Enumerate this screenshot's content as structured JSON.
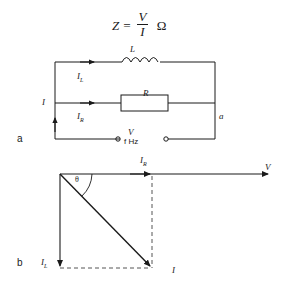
{
  "figure": {
    "equation": {
      "lhs": "Z",
      "equals": "=",
      "numerator": "V",
      "denominator": "I",
      "unit": "Ω"
    },
    "panel_a": {
      "tag": "a",
      "components": {
        "inductor_label": "L",
        "resistor_label": "R"
      },
      "currents": {
        "total": "I",
        "inductor_branch": "I",
        "inductor_branch_sub": "L",
        "resistor_branch": "I",
        "resistor_branch_sub": "R"
      },
      "source": {
        "voltage": "V",
        "frequency": "f Hz"
      },
      "terminal_right": "a"
    },
    "panel_b": {
      "tag": "b",
      "phasors": [
        {
          "name": "I",
          "sub": "R",
          "label": "I_R",
          "direction": "horizontal-right",
          "meaning": "resistive current in phase with V"
        },
        {
          "name": "I",
          "sub": "L",
          "label": "I_L",
          "direction": "vertical-down",
          "meaning": "inductive current lagging V by 90 degrees"
        },
        {
          "name": "I",
          "sub": "",
          "label": "I",
          "direction": "diagonal-down-right",
          "meaning": "resultant supply current"
        },
        {
          "name": "V",
          "sub": "",
          "label": "V",
          "direction": "horizontal-right",
          "meaning": "reference voltage phasor"
        }
      ],
      "angle_label": "θ"
    }
  },
  "colors": {
    "ink": "#1a1a1a",
    "paper": "#ffffff",
    "dashed": "#555555"
  }
}
